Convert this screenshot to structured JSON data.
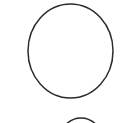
{
  "canvas": {
    "width": 123,
    "height": 123,
    "background_color": "#ffffff",
    "title": "Circle outline figure"
  },
  "style": {
    "stroke_color": "#2b2b2b",
    "stroke_width": 1.5,
    "fill": "none"
  },
  "shapes": [
    {
      "name": "primary-circle",
      "type": "ellipse",
      "center_x": 70.5,
      "center_y": 51,
      "radius_x": 42.5,
      "radius_y": 47,
      "stroke_color": "#2b2b2b",
      "stroke_width": 1.5,
      "fill": "none",
      "label": "Large circle outline"
    },
    {
      "name": "secondary-circle-partial",
      "type": "ellipse",
      "center_x": 81,
      "center_y": 147,
      "radius_x": 24,
      "radius_y": 29,
      "stroke_color": "#2b2b2b",
      "stroke_width": 1.5,
      "fill": "none",
      "label": "Top arc of second circle, cropped by bottom edge"
    }
  ],
  "accessibility": {
    "figure_description": "A white page showing a large thin-stroked circle outline in the upper area and the top arc of a smaller second circle entering from the bottom edge."
  }
}
